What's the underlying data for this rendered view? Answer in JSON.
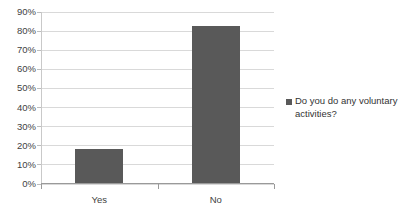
{
  "chart_data": {
    "type": "bar",
    "title": "",
    "xlabel": "",
    "ylabel": "",
    "categories": [
      "Yes",
      "No"
    ],
    "values": [
      18,
      82
    ],
    "series": [
      {
        "name": "Do you do any voluntary activities?",
        "values": [
          18,
          82
        ]
      }
    ],
    "ylim": [
      0,
      90
    ],
    "ytick_labels": [
      "90%",
      "80%",
      "70%",
      "60%",
      "50%",
      "40%",
      "30%",
      "20%",
      "10%",
      "0%"
    ],
    "ytick_values": [
      90,
      80,
      70,
      60,
      50,
      40,
      30,
      20,
      10,
      0
    ],
    "grid": true,
    "grid_axis": "y",
    "legend_position": "right",
    "legend_entries": [
      "Do you do any voluntary activities?"
    ],
    "bar_color": "#595959",
    "grid_color": "#d9d9d9",
    "axis_color": "#9a9a9a",
    "background_color": "#ffffff",
    "value_unit": "%"
  },
  "legend": {
    "entry_label": "Do you do any voluntary activities?",
    "marker_name": "legend-color-swatch"
  },
  "axes": {
    "y": {
      "ticks": [
        {
          "label": "90%",
          "value": 90
        },
        {
          "label": "80%",
          "value": 80
        },
        {
          "label": "70%",
          "value": 70
        },
        {
          "label": "60%",
          "value": 60
        },
        {
          "label": "50%",
          "value": 50
        },
        {
          "label": "40%",
          "value": 40
        },
        {
          "label": "30%",
          "value": 30
        },
        {
          "label": "20%",
          "value": 20
        },
        {
          "label": "10%",
          "value": 10
        },
        {
          "label": "0%",
          "value": 0
        }
      ]
    },
    "x": {
      "ticks": [
        {
          "label": "Yes"
        },
        {
          "label": "No"
        }
      ]
    }
  },
  "title": {
    "text": ""
  }
}
